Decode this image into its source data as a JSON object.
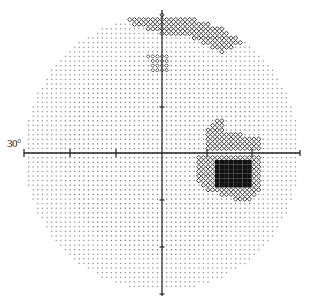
{
  "chart_data": {
    "type": "heatmap",
    "title": "",
    "subtitle": "Visual field grayscale plot (30° field)",
    "xlabel": "",
    "ylabel": "",
    "eccentricity_label": "30°",
    "field_extent_deg": 30,
    "axis_ticks_deg": [
      -30,
      -20,
      -10,
      0,
      10,
      20,
      30
    ],
    "grid": false,
    "legend": null,
    "geometry": {
      "center": [
        162,
        153
      ],
      "radius_px": 138,
      "deg_per_px": 0.2174,
      "horizontal_axis": {
        "x1": 24,
        "x2": 300,
        "y": 153
      },
      "vertical_axis": {
        "x": 162,
        "y1": 10,
        "y2": 296
      },
      "h_ticks_x": [
        70,
        116,
        207,
        252
      ],
      "v_ticks_y": [
        107,
        200,
        247
      ]
    },
    "colors": {
      "normal": "#7a7a7a",
      "mild_defect": "#555555",
      "moderate_defect": "#3a3a3a",
      "dense_defect": "#111111",
      "axis": "#222222"
    },
    "regions": [
      {
        "name": "superior-arcuate-defect",
        "level": "moderate",
        "polygon": [
          [
            122,
            10
          ],
          [
            200,
            10
          ],
          [
            240,
            24
          ],
          [
            246,
            42
          ],
          [
            222,
            52
          ],
          [
            190,
            38
          ],
          [
            162,
            34
          ],
          [
            135,
            26
          ],
          [
            122,
            18
          ]
        ]
      },
      {
        "name": "superior-paracentral-spot",
        "level": "mild",
        "polygon": [
          [
            148,
            56
          ],
          [
            168,
            56
          ],
          [
            168,
            72
          ],
          [
            150,
            74
          ]
        ]
      },
      {
        "name": "nasal-step-upper",
        "level": "moderate",
        "polygon": [
          [
            205,
            128
          ],
          [
            220,
            116
          ],
          [
            226,
            130
          ],
          [
            262,
            140
          ],
          [
            262,
            150
          ],
          [
            204,
            150
          ]
        ]
      },
      {
        "name": "nasal-step-lower",
        "level": "moderate",
        "polygon": [
          [
            196,
            157
          ],
          [
            260,
            157
          ],
          [
            260,
            192
          ],
          [
            248,
            204
          ],
          [
            210,
            192
          ],
          [
            196,
            180
          ]
        ]
      },
      {
        "name": "dense-scotoma",
        "level": "dense",
        "polygon": [
          [
            213,
            160
          ],
          [
            250,
            160
          ],
          [
            250,
            186
          ],
          [
            213,
            186
          ]
        ]
      }
    ]
  }
}
